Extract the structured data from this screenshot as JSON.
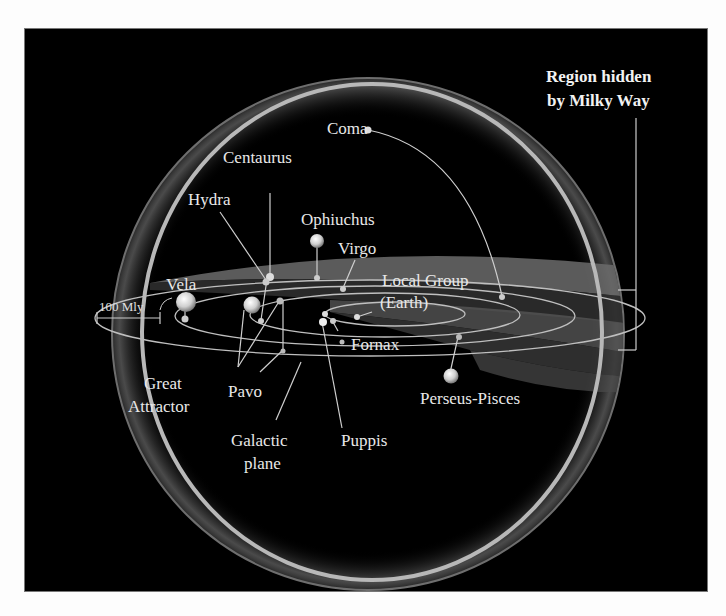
{
  "figure": {
    "title_callout": {
      "line1": "Region hidden",
      "line2": "by Milky Way"
    },
    "scale_bar": {
      "label": "100 Mly"
    },
    "labels": {
      "coma": "Coma",
      "centaurus": "Centaurus",
      "hydra": "Hydra",
      "ophiuchus": "Ophiuchus",
      "virgo": "Virgo",
      "vela": "Vela",
      "local_group_1": "Local Group",
      "local_group_2": "(Earth)",
      "fornax": "Fornax",
      "great_attractor_1": "Great",
      "great_attractor_2": "Attractor",
      "pavo": "Pavo",
      "galactic_plane_1": "Galactic",
      "galactic_plane_2": "plane",
      "puppis": "Puppis",
      "perseus_pisces": "Perseus-Pisces"
    },
    "colors": {
      "background": "#000000",
      "page": "#fdfdfd",
      "sphere_rim": "#b8b8b8",
      "zone_band": "#5a5a5a",
      "text": "#e8e8e8"
    }
  }
}
